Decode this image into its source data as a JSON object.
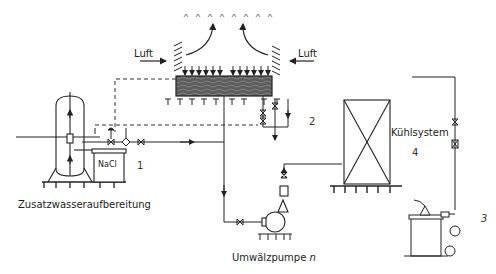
{
  "diagram": {
    "type": "cooling-tower-water-circuit",
    "labels": {
      "air_left": "Luft",
      "air_right": "Luft",
      "makeup_water": "Zusatzwasseraufbereitung",
      "salt": "NaCl",
      "cooling_system": "Kühlsystem",
      "pump": "Umwälzpumpe ",
      "pump_suffix": "n"
    },
    "numbers": {
      "n1": "1",
      "n2": "2",
      "n3": "3",
      "n4": "4"
    },
    "components": [
      {
        "id": "cooling-tower",
        "label": "Cooling tower basin with louvers and spray"
      },
      {
        "id": "softener",
        "label": "Zusatzwasseraufbereitung"
      },
      {
        "id": "brine-tank",
        "label": "NaCl"
      },
      {
        "id": "cooling-system",
        "label": "Kühlsystem"
      },
      {
        "id": "pump",
        "label": "Umwälzpumpe n"
      },
      {
        "id": "dosing-station",
        "label": "3"
      }
    ],
    "colors": {
      "line": "#222222",
      "basin_fill": "#6b6b6b"
    }
  }
}
